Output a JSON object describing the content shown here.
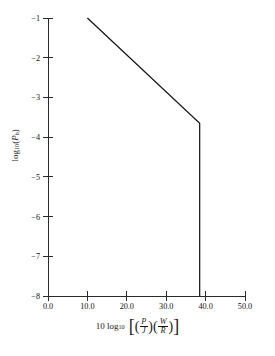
{
  "chart_data": {
    "type": "line",
    "title": "",
    "xlabel": "10 log10 [ (P/J)(W/R) ]",
    "ylabel": "log10(Pb)",
    "xlim": [
      0.0,
      50.0
    ],
    "ylim": [
      -8,
      -1
    ],
    "grid": false,
    "legend": null,
    "xticks": [
      0.0,
      10.0,
      20.0,
      30.0,
      40.0,
      50.0
    ],
    "xtick_labels": [
      "0.0",
      "10.0",
      "20.0",
      "30.0",
      "40.0",
      "50.0"
    ],
    "yticks": [
      -1,
      -2,
      -3,
      -4,
      -5,
      -6,
      -7,
      -8
    ],
    "ytick_labels": [
      "−1",
      "−2",
      "−3",
      "−4",
      "−5",
      "−6",
      "−7",
      "−8"
    ],
    "series": [
      {
        "name": "worst-case pulse jamming bit error probability",
        "x": [
          10.0,
          38.5,
          38.5
        ],
        "y": [
          -1.0,
          -3.65,
          -8.0
        ],
        "color": "#111111"
      }
    ],
    "annotations": [
      {
        "label": "knee",
        "x": 38.5,
        "y": -3.65
      }
    ]
  },
  "axis_labels": {
    "x_prefix": "10 log",
    "x_prefix_sub": "10",
    "x_num_1": "P",
    "x_den_1": "J",
    "x_num_2": "W",
    "x_den_2": "R",
    "y_prefix": "log",
    "y_prefix_sub": "10",
    "y_arg": "P",
    "y_arg_sub": "b",
    "bracket_open": "[",
    "bracket_close": "]",
    "paren_open": "(",
    "paren_close": ")"
  },
  "colors": {
    "background": "#ffffff",
    "axis": "#2a2a2a",
    "curve": "#111111",
    "text": "#111111"
  }
}
